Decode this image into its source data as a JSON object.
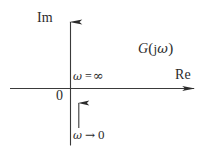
{
  "figure": {
    "kind": "nyquist-polar-plot",
    "background_color": "#ffffff",
    "stroke_color": "#2b2b2b"
  },
  "axes": {
    "imaginary": {
      "label": "Im",
      "orientation": "vertical",
      "arrow_direction": "up"
    },
    "real": {
      "label": "Re",
      "orientation": "horizontal",
      "arrow_direction": "right"
    },
    "origin_label": "0"
  },
  "annotations": {
    "transfer_function": {
      "g": "G",
      "open_paren": "(",
      "j": "j",
      "omega": "ω",
      "close_paren": ")",
      "full": "G(jω)"
    },
    "omega_infinity": {
      "omega": "ω",
      "relation": "=",
      "value": "∞",
      "full": "ω = ∞"
    },
    "omega_zero": {
      "omega": "ω",
      "relation": "→",
      "value": "0",
      "full": "ω → 0"
    }
  },
  "locus": {
    "description": "vertical ray on the imaginary axis with arrowhead pointing up toward the origin",
    "arrow_direction": "up"
  }
}
